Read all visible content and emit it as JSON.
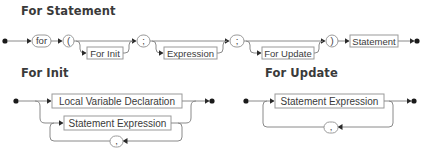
{
  "diagrams": {
    "for_statement": {
      "title": "For Statement",
      "terminals": {
        "for": "for",
        "open_paren": "(",
        "semi1": ";",
        "semi2": ";",
        "close_paren": ")"
      },
      "nonterminals": {
        "for_init": "For Init",
        "expression": "Expression",
        "for_update": "For Update",
        "statement": "Statement"
      }
    },
    "for_init": {
      "title": "For Init",
      "nonterminals": {
        "local_var_decl": "Local Variable Declaration",
        "statement_expression": "Statement Expression"
      },
      "terminals": {
        "comma": ","
      }
    },
    "for_update": {
      "title": "For Update",
      "nonterminals": {
        "statement_expression": "Statement Expression"
      },
      "terminals": {
        "comma": ","
      }
    }
  },
  "colors": {
    "title": "#3a3a3a",
    "line": "#8a8a8a",
    "box_border": "#9a9a9a",
    "arrow": "#2a2a2a"
  }
}
